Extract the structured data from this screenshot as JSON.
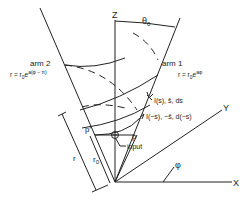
{
  "diagram": {
    "axes": {
      "z_label": "Z",
      "y_label": "Y",
      "x_label": "X",
      "phi_label": "φ",
      "theta_label": "θ",
      "theta_sub": "0"
    },
    "arm1": {
      "name": "arm 1",
      "equation_lhs": "r = r",
      "equation_sub": "0",
      "equation_e": "e",
      "equation_exp": "aφ"
    },
    "arm2": {
      "name": "arm 2",
      "equation_lhs": "r = r",
      "equation_sub": "0",
      "equation_e": "e",
      "equation_exp": "a(φ − π)"
    },
    "currents": {
      "forward": "I(s), ŝ, ds",
      "reverse": "I(−s), −ŝ, d(−s)"
    },
    "points": {
      "p": "p",
      "p_prime": "p'",
      "input": "input"
    },
    "dimensions": {
      "r": "r",
      "r0": "r",
      "r0_sub": "0"
    }
  }
}
